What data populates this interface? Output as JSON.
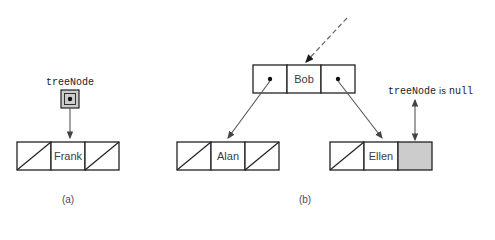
{
  "figure": {
    "background_color": "#ffffff",
    "stroke_color": "#222222",
    "fill_empty_color": "#ffffff",
    "fill_shaded_color": "#cccccc",
    "text_color": "#3d3d3d"
  },
  "panel_a": {
    "caption": "(a)",
    "pointer_label": "treeNode",
    "node": {
      "left_cell": "null-slash",
      "value": "Frank",
      "right_cell": "null-slash"
    },
    "pointer_box": {
      "icon": "pointer-dot-icon",
      "fill": "#cccccc"
    },
    "arrow": {
      "name": "treenode-to-frank-arrow",
      "style": "solid"
    }
  },
  "panel_b": {
    "caption": "(b)",
    "incoming_arrow": {
      "name": "incoming-dashed-arrow",
      "style": "dashed"
    },
    "root_node": {
      "left_cell": "pointer-dot",
      "value": "Bob",
      "right_cell": "pointer-dot"
    },
    "left_child_node": {
      "left_cell": "null-slash",
      "value": "Alan",
      "right_cell": "null-slash"
    },
    "right_child_node": {
      "left_cell": "null-slash",
      "value": "Ellen",
      "right_cell": "shaded"
    },
    "null_annotation": {
      "mono_text": "treeNode",
      "sans_text": "is",
      "mono_text_2": "null",
      "arrow": {
        "name": "treenode-null-double-arrow",
        "style": "double-headed"
      }
    },
    "left_arrow": {
      "name": "bob-left-to-alan-arrow",
      "style": "solid"
    },
    "right_arrow": {
      "name": "bob-right-to-ellen-arrow",
      "style": "solid"
    }
  }
}
